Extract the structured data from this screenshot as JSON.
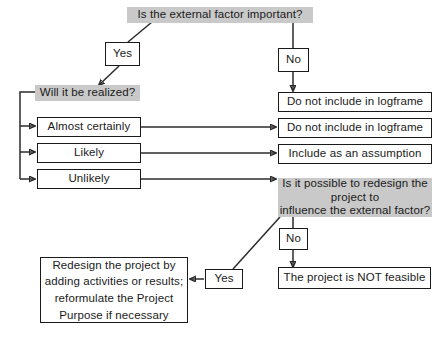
{
  "diagram": {
    "title_question": "Is the external factor important?",
    "nodes": {
      "root_question": "Is the external factor important?",
      "yes_top": "Yes",
      "no_top": "No",
      "realized_question": "Will it be realized?",
      "almost_certainly": "Almost certainly",
      "likely": "Likely",
      "unlikely": "Unlikely",
      "exclude_1": "Do not include in logframe",
      "exclude_2": "Do not include in logframe",
      "assumption": "Include as an assumption",
      "redesign_question": "Is it possible to redesign the\nproject to\ninfluence the external factor?",
      "no_bottom": "No",
      "yes_bottom": "Yes",
      "not_feasible": "The project is NOT feasible",
      "redesign_action": "Redesign the project by\nadding activities or results;\nreformulate the Project\nPurpose if necessary"
    },
    "colors": {
      "shaded_fill": "#c9c9c9",
      "box_border": "#1a1a1a",
      "line": "#2b2b2b",
      "text": "#1a1a1a",
      "background": "#ffffff"
    }
  }
}
